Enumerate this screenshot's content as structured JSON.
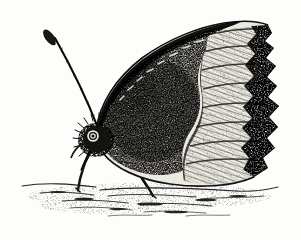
{
  "image": {
    "kind": "engraving-illustration",
    "subject": "butterfly-lateral-view",
    "common_name": "Mourning Cloak butterfly (underside, wings closed)",
    "style": "antique black-and-white stipple / line engraving",
    "width": 301,
    "height": 240,
    "background_color": "#fdfdfc",
    "ink_color": "#1a1a18",
    "mid_tone_color": "#5a5a55",
    "pale_band_color": "#e8e6df"
  },
  "parts": {
    "antenna": {
      "label": "antenna",
      "description": "single long antenna angling up-left from head, ending in an elongated club"
    },
    "head": {
      "label": "head",
      "description": "small furry head with round compound eye"
    },
    "eye": {
      "label": "compound eye",
      "description": "small circular eye with dark pupil and pale ring"
    },
    "thorax": {
      "label": "thorax",
      "description": "hairy dark thorax below the wing base"
    },
    "foreleg": {
      "label": "front leg",
      "description": "thin dark leg from thorax down to ground"
    },
    "midleg": {
      "label": "middle leg",
      "description": "thin dark leg angling down-right to ground"
    },
    "wing_disc": {
      "label": "wing disc",
      "description": "large dark stippled central field of the closed wings"
    },
    "wing_pale_band": {
      "label": "pale submarginal band",
      "description": "light striated band running along the outer wing before the margin"
    },
    "wing_margin": {
      "label": "scalloped wing margin",
      "description": "crenulated outer edge with repeating lunules"
    },
    "costa": {
      "label": "costal edge",
      "description": "dark banded leading edge sweeping from head to apex"
    },
    "ground": {
      "label": "ground line",
      "description": "loose horizontal hatch strokes indicating soil"
    }
  },
  "caption": "Butterfly resting on the ground, wings held closed, lateral view."
}
